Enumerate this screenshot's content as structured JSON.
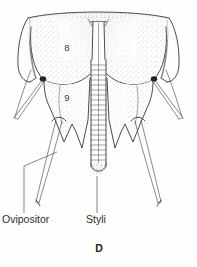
{
  "figure": {
    "panel_letter": "D",
    "caption_subject": "insect ovipositor ventral view",
    "style": {
      "ink_color": "#2b2b2b",
      "background_color": "#fefefe",
      "stipple_color": "#8d8d8d",
      "pivot_color": "#232323",
      "leader_color": "#55555a"
    },
    "segment_labels": [
      {
        "id": "segment-8",
        "text": "8",
        "x": 67,
        "y": 51
      },
      {
        "id": "segment-9",
        "text": "9",
        "x": 67,
        "y": 101
      }
    ],
    "annotations": [
      {
        "id": "ovipositor",
        "text": "Ovipositor",
        "text_x": 2,
        "text_y": 223,
        "leader": "M 24 213 L 24 166 L 57 152"
      },
      {
        "id": "styli",
        "text": "Styli",
        "text_x": 86,
        "text_y": 223,
        "leader": "M 97 213 L 97 176"
      }
    ],
    "panel_letter_pos": {
      "x": 99,
      "y": 252
    },
    "structures": {
      "tergite_8_label": "8",
      "tergite_9_label": "9",
      "shaft_name": "ovipositor shaft",
      "shaft_rung_count": 22,
      "appendage_name": "styli",
      "appendage_count": 4
    }
  }
}
